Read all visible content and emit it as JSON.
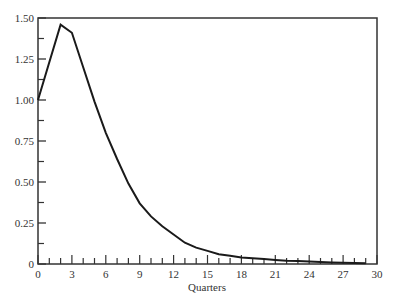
{
  "chart_data": {
    "type": "line",
    "title": "",
    "xlabel": "Quarters",
    "ylabel": "",
    "xlim": [
      0,
      30
    ],
    "ylim": [
      0,
      1.5
    ],
    "grid": false,
    "legend": null,
    "x_ticks": [
      0,
      3,
      6,
      9,
      12,
      15,
      18,
      21,
      24,
      27,
      30
    ],
    "x_minor_ticks_step": 1,
    "y_ticks": [
      0,
      0.25,
      0.5,
      0.75,
      1.0,
      1.25,
      1.5
    ],
    "y_tick_labels": [
      "0",
      "0.25",
      "0.50",
      "0.75",
      "1.00",
      "1.25",
      "1.50"
    ],
    "y_minor_ticks": [
      0.125,
      0.375,
      0.625,
      0.875,
      1.125,
      1.375
    ],
    "series": [
      {
        "name": "response",
        "x": [
          0,
          1,
          2,
          3,
          4,
          5,
          6,
          7,
          8,
          9,
          10,
          11,
          12,
          13,
          14,
          15,
          16,
          17,
          18,
          19,
          20,
          21,
          22,
          23,
          24,
          25,
          26,
          27,
          28,
          29
        ],
        "values": [
          1.0,
          1.23,
          1.46,
          1.41,
          1.2,
          0.99,
          0.8,
          0.64,
          0.49,
          0.37,
          0.29,
          0.23,
          0.18,
          0.13,
          0.1,
          0.08,
          0.06,
          0.05,
          0.04,
          0.035,
          0.03,
          0.025,
          0.02,
          0.018,
          0.015,
          0.012,
          0.01,
          0.008,
          0.006,
          0.005
        ]
      }
    ]
  }
}
